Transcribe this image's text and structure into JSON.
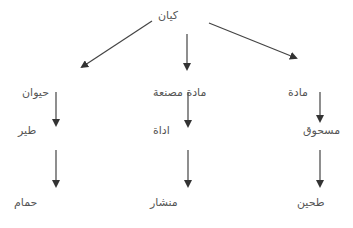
{
  "diagram": {
    "type": "hierarchy-tree",
    "direction": "top-down",
    "root": {
      "id": "root",
      "label": "كيان"
    },
    "branches": [
      {
        "id": "left",
        "levels": [
          {
            "id": "left-1",
            "label": "حيوان"
          },
          {
            "id": "left-2",
            "label": "طير"
          },
          {
            "id": "left-3",
            "label": "حمام"
          }
        ]
      },
      {
        "id": "center",
        "levels": [
          {
            "id": "center-1",
            "label": "مادة مصنعة"
          },
          {
            "id": "center-2",
            "label": "اداة"
          },
          {
            "id": "center-3",
            "label": "منشار"
          }
        ]
      },
      {
        "id": "right",
        "levels": [
          {
            "id": "right-1",
            "label": "مادة"
          },
          {
            "id": "right-2",
            "label": "مسحوق"
          },
          {
            "id": "right-3",
            "label": "طحين"
          }
        ]
      }
    ],
    "edges": [
      [
        "root",
        "left-1"
      ],
      [
        "root",
        "center-1"
      ],
      [
        "root",
        "right-1"
      ],
      [
        "left-1",
        "left-2"
      ],
      [
        "left-2",
        "left-3"
      ],
      [
        "center-1",
        "center-2"
      ],
      [
        "center-2",
        "center-3"
      ],
      [
        "right-1",
        "right-2"
      ],
      [
        "right-2",
        "right-3"
      ]
    ],
    "colors": {
      "arrow": "#333333",
      "text": "#555555",
      "background": "#ffffff"
    }
  }
}
